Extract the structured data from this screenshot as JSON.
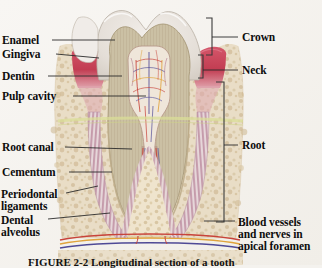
{
  "figure": {
    "caption": "FIGURE 2-2   Longitudinal section of a tooth",
    "background_color": "#f6f4f0"
  },
  "labels_left": [
    {
      "id": "enamel",
      "text": "Enamel",
      "x": 2,
      "y": 35,
      "leader": {
        "x1": 52,
        "y1": 40,
        "x2": 115,
        "y2": 40
      }
    },
    {
      "id": "gingiva",
      "text": "Gingiva",
      "x": 2,
      "y": 49,
      "leader": {
        "x1": 56,
        "y1": 54,
        "x2": 99,
        "y2": 58
      }
    },
    {
      "id": "dentin",
      "text": "Dentin",
      "x": 2,
      "y": 71,
      "leader": {
        "x1": 48,
        "y1": 76,
        "x2": 122,
        "y2": 76
      }
    },
    {
      "id": "pulp-cavity",
      "text": "Pulp cavity",
      "x": 2,
      "y": 91,
      "leader": {
        "x1": 73,
        "y1": 96,
        "x2": 146,
        "y2": 96
      }
    },
    {
      "id": "root-canal",
      "text": "Root canal",
      "x": 2,
      "y": 142,
      "leader": {
        "x1": 65,
        "y1": 147,
        "x2": 132,
        "y2": 149
      }
    },
    {
      "id": "cementum",
      "text": "Cementum",
      "x": 2,
      "y": 167,
      "leader": {
        "x1": 69,
        "y1": 172,
        "x2": 112,
        "y2": 172
      }
    },
    {
      "id": "periodontal-ligaments",
      "text": "Periodontal",
      "text2": "ligaments",
      "x": 1,
      "y": 188,
      "leader": {
        "x1": 66,
        "y1": 193,
        "x2": 98,
        "y2": 186
      }
    },
    {
      "id": "dental-alveolus",
      "text": "Dental",
      "text2": "alveolus",
      "x": 1,
      "y": 214,
      "leader": {
        "x1": 48,
        "y1": 219,
        "x2": 110,
        "y2": 213
      }
    }
  ],
  "labels_right": [
    {
      "id": "crown",
      "text": "Crown",
      "x": 242,
      "y": 32,
      "leader": {
        "x1": 212,
        "y1": 37,
        "x2": 238,
        "y2": 37
      }
    },
    {
      "id": "neck",
      "text": "Neck",
      "x": 242,
      "y": 65,
      "leader": {
        "x1": 203,
        "y1": 70,
        "x2": 238,
        "y2": 70
      }
    },
    {
      "id": "root",
      "text": "Root",
      "x": 242,
      "y": 140,
      "leader": {
        "x1": 224,
        "y1": 145,
        "x2": 238,
        "y2": 145
      }
    },
    {
      "id": "blood-vessels",
      "text": "Blood vessels",
      "text2": "and nerves in",
      "text3": "apical foramen",
      "x": 238,
      "y": 216,
      "leader": {
        "x1": 204,
        "y1": 221,
        "x2": 235,
        "y2": 221
      }
    }
  ],
  "brackets": [
    {
      "id": "crown-bracket",
      "x": 212,
      "y_top": 18,
      "y_bottom": 55,
      "tick": 6
    },
    {
      "id": "neck-bracket",
      "x": 203,
      "y_top": 55,
      "y_bottom": 78,
      "tick": 5
    },
    {
      "id": "root-bracket",
      "x": 224,
      "y_top": 82,
      "y_bottom": 222,
      "tick": 8
    }
  ],
  "anatomy": {
    "enamel_color": "#e7e2dc",
    "dentin_color": "#cbc0a4",
    "pulp_color": "#efe7dc",
    "gingiva_color": "#c8465a",
    "bone_color": "#e4d6bd",
    "ligament_color": "#c9a0ae",
    "artery_color": "#c8433a",
    "vein_color": "#4f4a96",
    "nerve_color": "#e0a33c",
    "junction_band_color": "#d9de97"
  }
}
